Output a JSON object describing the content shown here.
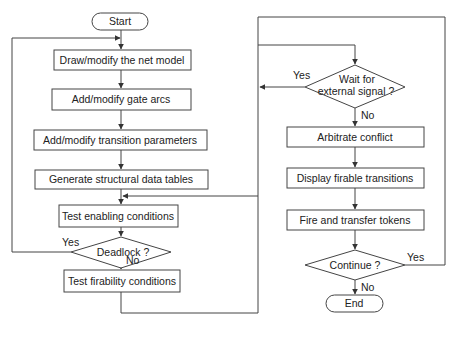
{
  "diagram": {
    "type": "flowchart",
    "colors": {
      "stroke": "#444444",
      "text": "#222222",
      "background": "#ffffff"
    },
    "nodes": {
      "start": {
        "shape": "terminal",
        "label": "Start"
      },
      "draw_model": {
        "shape": "process",
        "label": "Draw/modify the net model"
      },
      "gate_arcs": {
        "shape": "process",
        "label": "Add/modify gate arcs"
      },
      "transition_params": {
        "shape": "process",
        "label": "Add/modify transition parameters"
      },
      "data_tables": {
        "shape": "process",
        "label": "Generate structural data tables"
      },
      "test_enabling": {
        "shape": "process",
        "label": "Test enabling conditions"
      },
      "deadlock": {
        "shape": "decision",
        "label": "Deadlock ?"
      },
      "test_firability": {
        "shape": "process",
        "label": "Test firability conditions"
      },
      "wait_signal": {
        "shape": "decision",
        "label_line1": "Wait for",
        "label_line2": "external signal ?"
      },
      "arbitrate": {
        "shape": "process",
        "label": "Arbitrate conflict"
      },
      "display_firable": {
        "shape": "process",
        "label": "Display firable transitions"
      },
      "fire_transfer": {
        "shape": "process",
        "label": "Fire and transfer tokens"
      },
      "continue": {
        "shape": "decision",
        "label": "Continue ?"
      },
      "end": {
        "shape": "terminal",
        "label": "End"
      }
    },
    "edge_labels": {
      "deadlock_yes": "Yes",
      "deadlock_no": "No",
      "wait_yes": "Yes",
      "wait_no": "No",
      "continue_yes": "Yes",
      "continue_no": "No"
    },
    "edges": [
      {
        "from": "start",
        "to": "draw_model"
      },
      {
        "from": "draw_model",
        "to": "gate_arcs"
      },
      {
        "from": "gate_arcs",
        "to": "transition_params"
      },
      {
        "from": "transition_params",
        "to": "data_tables"
      },
      {
        "from": "data_tables",
        "to": "test_enabling"
      },
      {
        "from": "test_enabling",
        "to": "deadlock"
      },
      {
        "from": "deadlock",
        "to": "draw_model",
        "label": "Yes"
      },
      {
        "from": "deadlock",
        "to": "test_firability",
        "label": "No"
      },
      {
        "from": "test_firability",
        "to": "wait_signal"
      },
      {
        "from": "wait_signal",
        "to": "test_enabling",
        "label": "Yes"
      },
      {
        "from": "wait_signal",
        "to": "arbitrate",
        "label": "No"
      },
      {
        "from": "arbitrate",
        "to": "display_firable"
      },
      {
        "from": "display_firable",
        "to": "fire_transfer"
      },
      {
        "from": "fire_transfer",
        "to": "continue"
      },
      {
        "from": "continue",
        "to": "wait_signal",
        "label": "Yes"
      },
      {
        "from": "continue",
        "to": "end",
        "label": "No"
      }
    ]
  }
}
